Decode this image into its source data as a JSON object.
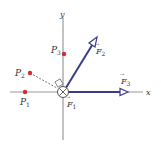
{
  "diagram": {
    "axes": {
      "x_label": "x",
      "y_label": "y",
      "color": "#9a9a9a"
    },
    "origin": {
      "symbol": "circled-cross",
      "meaning": "force into page"
    },
    "points": [
      {
        "name": "P",
        "sub": "1",
        "color": "#d62b2b"
      },
      {
        "name": "P",
        "sub": "2",
        "color": "#d62b2b"
      },
      {
        "name": "P",
        "sub": "3",
        "color": "#d62b2b"
      }
    ],
    "forces": [
      {
        "name": "F",
        "sub": "1",
        "direction": "into page"
      },
      {
        "name": "F",
        "sub": "2",
        "direction": "up-right",
        "color": "#3c3c8c"
      },
      {
        "name": "F",
        "sub": "3",
        "direction": "+x",
        "color": "#3c3c8c"
      }
    ],
    "vector_arrow": "→"
  }
}
